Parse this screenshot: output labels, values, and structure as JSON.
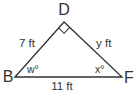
{
  "diagram": {
    "type": "right-triangle",
    "colors": {
      "stroke": "#333333",
      "text": "#333333",
      "background": "#ffffff"
    },
    "vertices": [
      {
        "name": "D",
        "label": "D",
        "right_angle": true
      },
      {
        "name": "B",
        "label": "B"
      },
      {
        "name": "F",
        "label": "F"
      }
    ],
    "sides": {
      "BD": {
        "label": "7 ft"
      },
      "DF": {
        "label": "y ft"
      },
      "BF": {
        "label": "11 ft"
      }
    },
    "angles": {
      "B": {
        "label": "w°"
      },
      "F": {
        "label": "x°"
      }
    }
  }
}
